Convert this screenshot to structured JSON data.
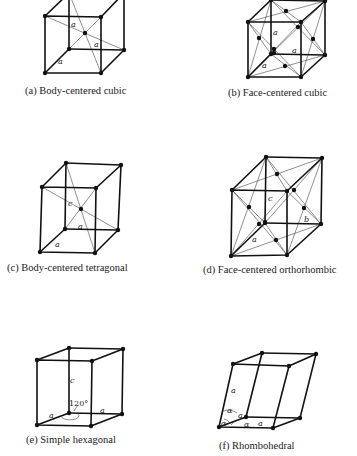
{
  "figure": {
    "panels": [
      {
        "id": "a",
        "caption": "(a)  Body-centered cubic",
        "labels": [
          "a",
          "a",
          "a"
        ]
      },
      {
        "id": "b",
        "caption": "(b)  Face-centered cubic",
        "labels": [
          "a",
          "a",
          "a"
        ]
      },
      {
        "id": "c",
        "caption": "(c)  Body-centered tetragonal",
        "labels": [
          "c",
          "a",
          "a"
        ]
      },
      {
        "id": "d",
        "caption": "(d)  Face-centered orthorhombic",
        "labels": [
          "c",
          "b",
          "a"
        ]
      },
      {
        "id": "e",
        "caption": "(e)  Simple hexagonal",
        "labels": [
          "c",
          "120°",
          "a",
          "a"
        ]
      },
      {
        "id": "f",
        "caption": "(f)  Rhombohedral",
        "labels": [
          "a",
          "α",
          "a",
          "α",
          "α",
          "a"
        ]
      }
    ]
  }
}
